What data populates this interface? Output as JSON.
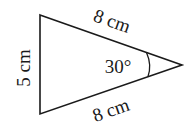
{
  "diagram": {
    "type": "triangle",
    "stroke_color": "#1a1a1a",
    "sides": [
      {
        "id": "left",
        "label": "5 cm"
      },
      {
        "id": "top",
        "label": "8 cm"
      },
      {
        "id": "bottom",
        "label": "8 cm"
      }
    ],
    "angle": {
      "vertex": "right",
      "label": "30°"
    }
  }
}
